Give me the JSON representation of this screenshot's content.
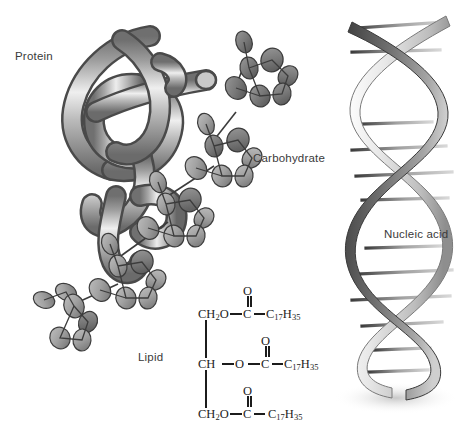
{
  "figure": {
    "background_color": "#ffffff"
  },
  "labels": {
    "protein": "Protein",
    "carbohydrate": "Carbohydrate",
    "nucleic_acid": "Nucleic acid",
    "lipid": "Lipid"
  },
  "lipid_formula": {
    "description": "Triglyceride (tristearin) structural formula",
    "rows": [
      {
        "backbone": "CH",
        "backbone_sub": "2",
        "backbone_tail": "O",
        "ester_o": "O",
        "carbonyl": "C",
        "carbonyl_o": "O",
        "chain": "C",
        "chain_sub1": "17",
        "chain_h": "H",
        "chain_sub2": "35"
      },
      {
        "backbone": "CH",
        "backbone_sub": "",
        "backbone_tail": "",
        "ester_o": "O",
        "carbonyl": "C",
        "carbonyl_o": "O",
        "chain": "C",
        "chain_sub1": "17",
        "chain_h": "H",
        "chain_sub2": "35"
      },
      {
        "backbone": "CH",
        "backbone_sub": "2",
        "backbone_tail": "O",
        "ester_o": "O",
        "carbonyl": "C",
        "carbonyl_o": "O",
        "chain": "C",
        "chain_sub1": "17",
        "chain_h": "H",
        "chain_sub2": "35"
      }
    ]
  },
  "colors": {
    "ink": "#1c1c1c",
    "label_text": "#3a3a3a",
    "tube_light": "#f2f2f2",
    "tube_mid": "#9b9b9b",
    "tube_dark": "#5a5a5a",
    "tube_outline": "#444444",
    "sugar_fill": "#a8a8a8",
    "sugar_fill_dark": "#7d7d7d",
    "sugar_outline": "#3c3c3c",
    "helix_light": "#dedede",
    "helix_dark": "#4a4a4a"
  },
  "structures": {
    "protein": {
      "name": "folded-polypeptide-tube",
      "style": "ribbon tube coil"
    },
    "carbohydrate": {
      "name": "branched-polysaccharide",
      "unit_count": 5,
      "style": "hexagonal sugar rings"
    },
    "nucleic_acid": {
      "name": "dna-double-helix",
      "turns": 3,
      "rungs": 13
    },
    "lipid": {
      "name": "triglyceride",
      "ester_groups": 3
    }
  }
}
